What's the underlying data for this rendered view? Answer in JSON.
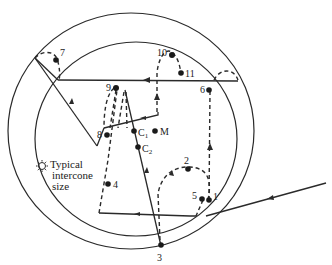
{
  "figure": {
    "colors": {
      "ink": "#2a2a2a",
      "background": "#ffffff"
    }
  },
  "points": [
    {
      "id": "p1",
      "label": "1"
    },
    {
      "id": "p2",
      "label": "2"
    },
    {
      "id": "p3",
      "label": "3"
    },
    {
      "id": "p4",
      "label": "4"
    },
    {
      "id": "p5",
      "label": "5"
    },
    {
      "id": "p6",
      "label": "6"
    },
    {
      "id": "p7",
      "label": "7"
    },
    {
      "id": "p8",
      "label": "8"
    },
    {
      "id": "p9",
      "label": "9"
    },
    {
      "id": "p10",
      "label": "10"
    },
    {
      "id": "p11",
      "label": "11"
    },
    {
      "id": "pM",
      "label": "M"
    },
    {
      "id": "pC1",
      "label": "C",
      "sub": "1"
    },
    {
      "id": "pC2",
      "label": "C",
      "sub": "2"
    }
  ],
  "legend": {
    "icon": "sun-icon",
    "lines": [
      "Typical",
      "intercone",
      "size"
    ]
  }
}
